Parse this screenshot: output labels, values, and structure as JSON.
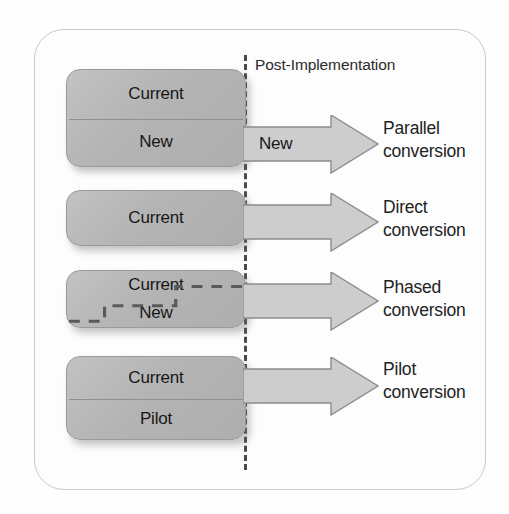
{
  "figure": {
    "title_marker": "Post-Implementation",
    "frame": {
      "border_color": "#c9c9c9"
    },
    "colors": {
      "box_fill": "#b4b4b4",
      "box_border": "#9a9a9a",
      "arrow_fill": "#cdcdcd",
      "arrow_border": "#8c8c8c",
      "cutover_line": "#4a4a4a",
      "text": "#1a1a1a"
    }
  },
  "cutover": {
    "label": "Post-Implementation",
    "style": "dashed-vertical"
  },
  "rows": [
    {
      "id": "parallel",
      "box_segments": [
        "Current",
        "New"
      ],
      "divider": true,
      "staircase": false,
      "arrow_caption": "New",
      "label_line1": "Parallel",
      "label_line2": "conversion"
    },
    {
      "id": "direct",
      "box_segments": [
        "Current"
      ],
      "divider": false,
      "staircase": false,
      "arrow_caption": "",
      "label_line1": "Direct",
      "label_line2": "conversion"
    },
    {
      "id": "phased",
      "box_segments": [
        "Current",
        "New"
      ],
      "divider": false,
      "staircase": true,
      "arrow_caption": "",
      "label_line1": "Phased",
      "label_line2": "conversion"
    },
    {
      "id": "pilot",
      "box_segments": [
        "Current",
        "Pilot"
      ],
      "divider": true,
      "staircase": false,
      "arrow_caption": "",
      "label_line1": "Pilot",
      "label_line2": "conversion"
    }
  ]
}
